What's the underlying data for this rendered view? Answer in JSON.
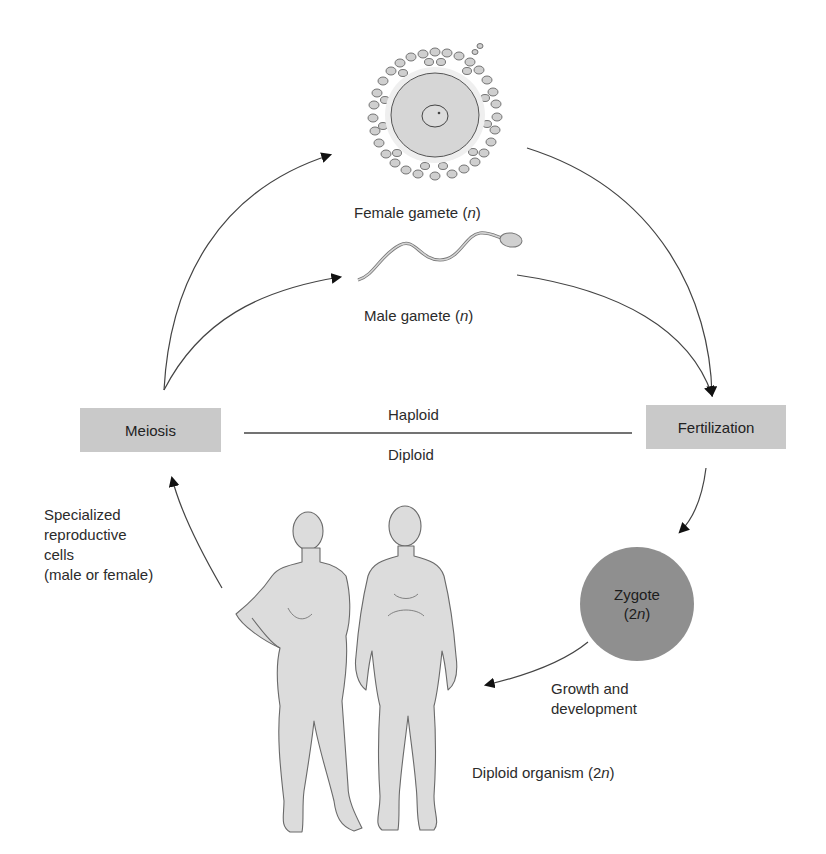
{
  "diagram": {
    "type": "life-cycle",
    "boxes": {
      "meiosis": "Meiosis",
      "fertilization": "Fertilization"
    },
    "divider": {
      "above": "Haploid",
      "below": "Diploid"
    },
    "gametes": {
      "female": {
        "text": "Female gamete (",
        "var": "n",
        "close": ")"
      },
      "male": {
        "text": "Male gamete (",
        "var": "n",
        "close": ")"
      }
    },
    "zygote": {
      "line1": "Zygote",
      "line2_open": "(2",
      "line2_var": "n",
      "line2_close": ")"
    },
    "growth_label": {
      "line1": "Growth and",
      "line2": "development"
    },
    "organism_label": {
      "text": "Diploid organism (2",
      "var": "n",
      "close": ")"
    },
    "specialized_label": {
      "line1": "Specialized",
      "line2": "reproductive",
      "line3": "cells",
      "line4": "(male or female)"
    },
    "colors": {
      "box_fill": "#c9c9c9",
      "zygote_fill": "#8f8f8f",
      "figure_fill": "#dcdcdc",
      "line": "#333333"
    }
  }
}
